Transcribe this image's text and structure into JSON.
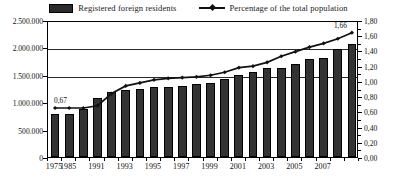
{
  "legend": {
    "items": [
      {
        "label": "Registered foreign residents",
        "marker": "bar-swatch-icon",
        "color": "#2b2b2b"
      },
      {
        "label": "Percentage of the total population",
        "marker": "line-diamond-icon",
        "color": "#111111"
      }
    ]
  },
  "annotations": [
    {
      "text": "0,67",
      "series": "percentage",
      "x_index": 0
    },
    {
      "text": "1,66",
      "series": "percentage",
      "x_index": 21
    }
  ],
  "chart_data": {
    "type": "bar",
    "title": "",
    "subtitle": "",
    "xlabel": "",
    "ylabel": "",
    "grid": true,
    "legend_position": "top",
    "categories": [
      "1975",
      "1985",
      "1990",
      "1991",
      "1992",
      "1993",
      "1994",
      "1995",
      "1996",
      "1997",
      "1998",
      "1999",
      "2000",
      "2001",
      "2002",
      "2003",
      "2004",
      "2005",
      "2006",
      "2007",
      "2008",
      "2009"
    ],
    "x_tick_labels": [
      "1975",
      "1985",
      "1991",
      "1993",
      "1995",
      "1997",
      "1999",
      "2001",
      "2003",
      "2005",
      "2007"
    ],
    "x_tick_indices": [
      0,
      1,
      3,
      5,
      7,
      9,
      11,
      13,
      15,
      17,
      19
    ],
    "y_left": {
      "label": "",
      "ticks": [
        "0",
        "500.000",
        "1.000.000",
        "1.500.000",
        "2.000.000",
        "2.500.000"
      ],
      "tick_values": [
        0,
        500000,
        1000000,
        1500000,
        2000000,
        2500000
      ],
      "ylim": [
        0,
        2500000
      ]
    },
    "y_right": {
      "label": "",
      "ticks": [
        "0,00",
        "0,20",
        "0,40",
        "0,60",
        "0,80",
        "1,00",
        "1,20",
        "1,40",
        "1,60",
        "1,80"
      ],
      "tick_values": [
        0,
        0.2,
        0.4,
        0.6,
        0.8,
        1.0,
        1.2,
        1.4,
        1.6,
        1.8
      ],
      "ylim": [
        0,
        1.8
      ]
    },
    "series": [
      {
        "name": "Registered foreign residents",
        "type": "bar",
        "axis": "left",
        "color": "#333333",
        "values": [
          780000,
          790000,
          870000,
          1080000,
          1180000,
          1230000,
          1250000,
          1270000,
          1270000,
          1300000,
          1330000,
          1350000,
          1430000,
          1500000,
          1560000,
          1620000,
          1620000,
          1700000,
          1780000,
          1800000,
          1980000,
          2060000
        ]
      },
      {
        "name": "Percentage of the total population",
        "type": "line",
        "axis": "right",
        "color": "#111111",
        "marker": "diamond",
        "values": [
          0.67,
          0.67,
          0.67,
          0.7,
          0.86,
          0.96,
          1.0,
          1.04,
          1.06,
          1.07,
          1.08,
          1.1,
          1.14,
          1.2,
          1.22,
          1.27,
          1.35,
          1.41,
          1.47,
          1.52,
          1.58,
          1.66
        ]
      }
    ]
  }
}
